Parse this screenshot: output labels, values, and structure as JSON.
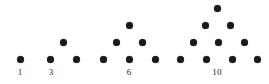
{
  "figure": {
    "width": 269,
    "height": 84,
    "background_color": "#ffffff",
    "dot_color": "#1a1a1a",
    "label_color": "#232323",
    "dot_diameter": 7
  },
  "chart_data": {
    "type": "scatter",
    "title": "",
    "subtitle": "",
    "xlabel": "",
    "ylabel": "",
    "grid": false,
    "legend": null,
    "categories": [
      "1",
      "3",
      "6",
      "10"
    ],
    "values": [
      1,
      3,
      6,
      10
    ],
    "xlim": [
      0,
      269
    ],
    "ylim": [
      0,
      84
    ],
    "groups": [
      {
        "label": "1",
        "count": 1,
        "rows": 1,
        "label_x": 20,
        "label_y": 67,
        "points": [
          {
            "x": 20,
            "y": 59
          }
        ]
      },
      {
        "label": "3",
        "count": 3,
        "rows": 2,
        "label_x": 51,
        "label_y": 67,
        "points": [
          {
            "x": 50,
            "y": 59
          },
          {
            "x": 76,
            "y": 59
          },
          {
            "x": 63,
            "y": 42
          }
        ]
      },
      {
        "label": "6",
        "count": 6,
        "rows": 3,
        "label_x": 129,
        "label_y": 67,
        "points": [
          {
            "x": 103,
            "y": 59
          },
          {
            "x": 129,
            "y": 59
          },
          {
            "x": 155,
            "y": 59
          },
          {
            "x": 116,
            "y": 42
          },
          {
            "x": 142,
            "y": 42
          },
          {
            "x": 129,
            "y": 25
          }
        ]
      },
      {
        "label": "10",
        "count": 10,
        "rows": 4,
        "label_x": 217,
        "label_y": 67,
        "points": [
          {
            "x": 180,
            "y": 59
          },
          {
            "x": 206,
            "y": 59
          },
          {
            "x": 232,
            "y": 59
          },
          {
            "x": 257,
            "y": 59
          },
          {
            "x": 193,
            "y": 42
          },
          {
            "x": 218,
            "y": 42
          },
          {
            "x": 244,
            "y": 42
          },
          {
            "x": 205,
            "y": 25
          },
          {
            "x": 230,
            "y": 25
          },
          {
            "x": 217,
            "y": 8
          }
        ]
      }
    ]
  }
}
